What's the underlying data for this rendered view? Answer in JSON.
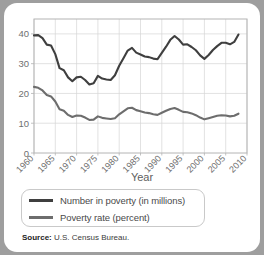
{
  "card": {
    "source_label": "Source:",
    "source_text": "U.S. Census Bureau."
  },
  "legend": {
    "items": [
      {
        "label": "Number in poverty (in millions)",
        "color": "#3f3f3f",
        "swatch_name": "legend-swatch-number-in-poverty"
      },
      {
        "label": "Poverty rate (percent)",
        "color": "#6d6d6d",
        "swatch_name": "legend-swatch-poverty-rate"
      }
    ]
  },
  "chart_data": {
    "type": "line",
    "title": "",
    "xlabel": "Year",
    "ylabel": "",
    "xlim": [
      1960,
      2010
    ],
    "ylim": [
      0,
      45
    ],
    "xticks": [
      1960,
      1965,
      1970,
      1975,
      1980,
      1985,
      1990,
      1995,
      2000,
      2005,
      2010
    ],
    "yticks": [
      0,
      10,
      20,
      30,
      40
    ],
    "xtick_labels": [
      "1960",
      "1965",
      "1970",
      "1975",
      "1980",
      "1985",
      "1990",
      "1995",
      "2000",
      "2005",
      "2010"
    ],
    "ytick_labels": [
      "0",
      "10",
      "20",
      "30",
      "40"
    ],
    "grid": true,
    "legend_position": "below",
    "axis_color": "#b4b4b4",
    "grid_color": "#d6d6d6",
    "tick_label_color": "#6f6f6f",
    "x": [
      1960,
      1961,
      1962,
      1963,
      1964,
      1965,
      1966,
      1967,
      1968,
      1969,
      1970,
      1971,
      1972,
      1973,
      1974,
      1975,
      1976,
      1977,
      1978,
      1979,
      1980,
      1981,
      1982,
      1983,
      1984,
      1985,
      1986,
      1987,
      1988,
      1989,
      1990,
      1991,
      1992,
      1993,
      1994,
      1995,
      1996,
      1997,
      1998,
      1999,
      2000,
      2001,
      2002,
      2003,
      2004,
      2005,
      2006,
      2007,
      2008
    ],
    "series": [
      {
        "name": "Number in poverty (in millions)",
        "color": "#3f3f3f",
        "values": [
          39.5,
          39.6,
          38.6,
          36.4,
          36.1,
          33.2,
          28.5,
          27.8,
          25.4,
          24.1,
          25.4,
          25.6,
          24.5,
          23.0,
          23.4,
          25.9,
          25.0,
          24.7,
          24.5,
          26.1,
          29.3,
          31.8,
          34.4,
          35.3,
          33.7,
          33.1,
          32.4,
          32.2,
          31.7,
          31.5,
          33.6,
          35.7,
          38.0,
          39.3,
          38.1,
          36.4,
          36.5,
          35.6,
          34.5,
          32.8,
          31.6,
          32.9,
          34.6,
          35.9,
          37.0,
          37.0,
          36.5,
          37.3,
          39.8
        ]
      },
      {
        "name": "Poverty rate (percent)",
        "color": "#6d6d6d",
        "values": [
          22.2,
          21.9,
          21.0,
          19.5,
          19.0,
          17.3,
          14.7,
          14.2,
          12.8,
          12.1,
          12.6,
          12.5,
          11.9,
          11.1,
          11.2,
          12.3,
          11.8,
          11.6,
          11.4,
          11.7,
          13.0,
          14.0,
          15.0,
          15.2,
          14.4,
          14.0,
          13.6,
          13.4,
          13.0,
          12.8,
          13.5,
          14.2,
          14.8,
          15.1,
          14.5,
          13.8,
          13.7,
          13.3,
          12.7,
          11.9,
          11.3,
          11.7,
          12.1,
          12.5,
          12.7,
          12.6,
          12.3,
          12.5,
          13.2
        ]
      }
    ]
  }
}
